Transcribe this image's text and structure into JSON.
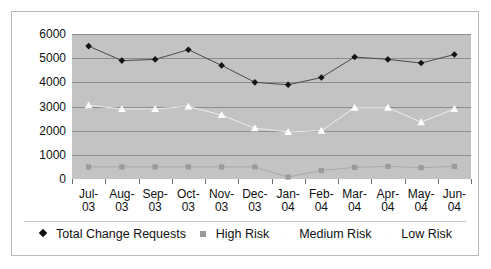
{
  "chart_data": {
    "type": "line",
    "title": "",
    "xlabel": "",
    "ylabel": "",
    "ylim": [
      0,
      6000
    ],
    "ytick_step": 1000,
    "yticks": [
      "6000",
      "5000",
      "4000",
      "3000",
      "2000",
      "1000",
      "0"
    ],
    "grid": true,
    "legend_position": "bottom",
    "plot_background": "#c3c3c3",
    "categories": [
      "Jul-03",
      "Aug-03",
      "Sep-03",
      "Oct-03",
      "Nov-03",
      "Dec-03",
      "Jan-04",
      "Feb-04",
      "Mar-04",
      "Apr-04",
      "May-04",
      "Jun-04"
    ],
    "category_lines": [
      {
        "l1": "Jul-",
        "l2": "03"
      },
      {
        "l1": "Aug-",
        "l2": "03"
      },
      {
        "l1": "Sep-",
        "l2": "03"
      },
      {
        "l1": "Oct-",
        "l2": "03"
      },
      {
        "l1": "Nov-",
        "l2": "03"
      },
      {
        "l1": "Dec-",
        "l2": "03"
      },
      {
        "l1": "Jan-",
        "l2": "04"
      },
      {
        "l1": "Feb-",
        "l2": "04"
      },
      {
        "l1": "Mar-",
        "l2": "04"
      },
      {
        "l1": "Apr-",
        "l2": "04"
      },
      {
        "l1": "May-",
        "l2": "04"
      },
      {
        "l1": "Jun-",
        "l2": "04"
      }
    ],
    "series": [
      {
        "name": "Total Change Requests",
        "marker": "diamond",
        "color": "#141414",
        "line_color": "#4a4a4a",
        "values": [
          5500,
          4900,
          4950,
          5350,
          4700,
          4000,
          3900,
          4200,
          5050,
          4950,
          4800,
          5150
        ]
      },
      {
        "name": "High Risk",
        "marker": "square",
        "color": "#9a9a9a",
        "line_color": "#a8a8a8",
        "values": [
          500,
          500,
          500,
          500,
          500,
          500,
          80,
          350,
          480,
          520,
          470,
          520
        ]
      },
      {
        "name": "Medium Risk",
        "marker": "triangle",
        "color": "#fdfdfd",
        "line_color": "#ededed",
        "values": [
          3050,
          2900,
          2900,
          3000,
          2650,
          2100,
          1950,
          2000,
          2950,
          2950,
          2350,
          2900
        ]
      },
      {
        "name": "Low Risk",
        "marker": "none",
        "color": "#fbfbfb",
        "line_color": "#fbfbfb",
        "values": [
          null,
          null,
          null,
          null,
          null,
          null,
          null,
          null,
          null,
          null,
          null,
          null
        ]
      }
    ]
  },
  "legend": {
    "items": [
      {
        "label": "Total Change Requests",
        "marker": "diamond"
      },
      {
        "label": "High Risk",
        "marker": "square"
      },
      {
        "label": "Medium Risk",
        "marker": "triangle"
      },
      {
        "label": "Low Risk",
        "marker": "blank"
      }
    ]
  }
}
